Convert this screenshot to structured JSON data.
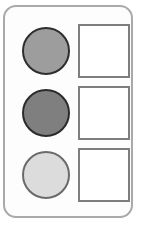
{
  "figure": {
    "title": "",
    "type": "shape-matching-grid",
    "rows": 3,
    "columns": 2
  },
  "frame": {
    "shape": "rounded-rectangle",
    "border_color": "#a9a9a9",
    "fill_color": "#fdfdfd",
    "corner_radius_px": 13
  },
  "items": [
    {
      "row": 1,
      "circle": {
        "shape": "circle",
        "fill_color": "#9d9d9d",
        "border_color": "#2e2e2e",
        "shade": "medium gray",
        "label": ""
      },
      "box": {
        "shape": "square",
        "fill_color": "#ffffff",
        "border_color": "#7e7e7e",
        "value": "",
        "placeholder": ""
      }
    },
    {
      "row": 2,
      "circle": {
        "shape": "circle",
        "fill_color": "#7f7f7f",
        "border_color": "#2b2b2b",
        "shade": "dark gray",
        "label": ""
      },
      "box": {
        "shape": "square",
        "fill_color": "#ffffff",
        "border_color": "#7e7e7e",
        "value": "",
        "placeholder": ""
      }
    },
    {
      "row": 3,
      "circle": {
        "shape": "circle",
        "fill_color": "#dcdcdc",
        "border_color": "#6a6a6a",
        "shade": "light gray",
        "label": ""
      },
      "box": {
        "shape": "square",
        "fill_color": "#ffffff",
        "border_color": "#7e7e7e",
        "value": "",
        "placeholder": ""
      }
    }
  ],
  "colors": {
    "background": "#ffffff",
    "frame_border": "#a9a9a9",
    "box_border": "#7e7e7e",
    "circle_dark": "#7f7f7f",
    "circle_medium": "#9d9d9d",
    "circle_light": "#dcdcdc"
  }
}
